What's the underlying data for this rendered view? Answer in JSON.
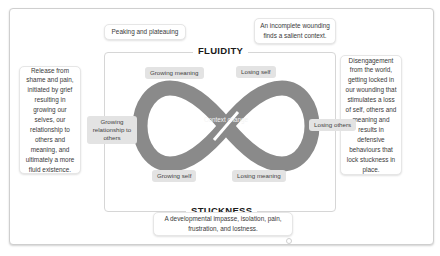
{
  "diagram": {
    "top_left_note": "Peaking and plateauing",
    "top_right_note": "An incomplete wounding finds a salient context.",
    "fluidity_title": "FLUIDITY",
    "stuckness_title": "STUCKNESS",
    "left_card": "Release from shame and pain, initiated by grief resulting in growing our selves, our relationship to others and meaning, and ultimately a more fluid existence.",
    "right_card": "Disengagement from the world, getting locked in our wounding that stimulates a loss of self, others and meaning and results in defensive behaviours that lock stuckness in place.",
    "bottom_card": "A developmental impasse, isolation, pain, frustration, and lostness.",
    "center_label": "Context change",
    "labels": {
      "growing_meaning": "Growing meaning",
      "losing_self": "Losing self",
      "growing_relationship": "Growing relationship to others",
      "losing_others": "Losing others",
      "growing_self": "Growing self",
      "losing_meaning": "Losing meaning"
    },
    "colors": {
      "loop": "#8a8a8a",
      "pill_bg": "#e3e3e3",
      "border": "#d6d6d6"
    }
  }
}
